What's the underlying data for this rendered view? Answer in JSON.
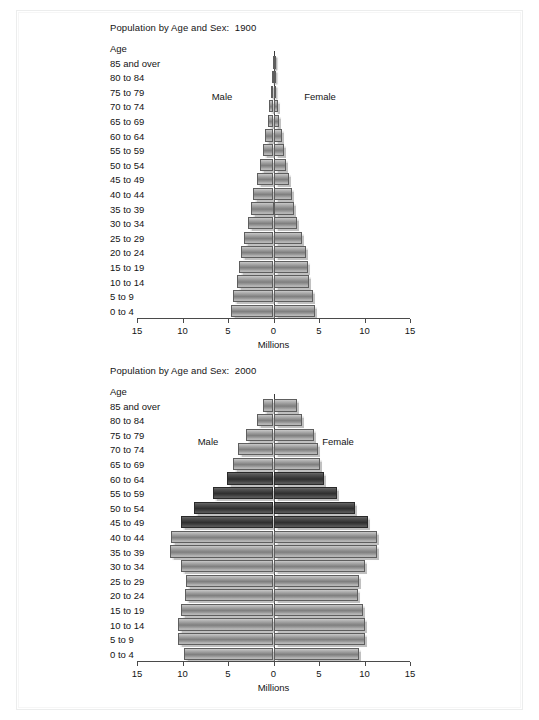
{
  "figure": {
    "background": "#ffffff",
    "frame_color": "#ececec"
  },
  "charts": [
    {
      "id": "chart-1900",
      "title": "Population by Age and Sex:  1900",
      "age_header": "Age",
      "xlabel": "Millions",
      "male_label": "Male",
      "female_label": "Female"
    },
    {
      "id": "chart-2000",
      "title": "Population by Age and Sex:  2000",
      "age_header": "Age",
      "xlabel": "Millions",
      "male_label": "Male",
      "female_label": "Female",
      "legend_label": "Baby boom"
    }
  ],
  "chart_data": [
    {
      "type": "bar",
      "subtype": "population-pyramid",
      "title": "Population by Age and Sex:  1900",
      "xlabel": "Millions",
      "ylabel": "Age",
      "xlim": [
        -15,
        15
      ],
      "xticks": [
        -15,
        -10,
        -5,
        0,
        5,
        10,
        15
      ],
      "xticklabels": [
        "15",
        "10",
        "5",
        "0",
        "5",
        "10",
        "15"
      ],
      "grid": false,
      "legend": null,
      "categories": [
        "0 to 4",
        "5 to 9",
        "10 to 14",
        "15 to 19",
        "20 to 24",
        "25 to 29",
        "30 to 34",
        "35 to 39",
        "40 to 44",
        "45 to 49",
        "50 to 54",
        "55 to 59",
        "60 to 64",
        "65 to 69",
        "70 to 74",
        "75 to 79",
        "80 to 84",
        "85 and over"
      ],
      "series": [
        {
          "name": "Male",
          "side": "left",
          "values": [
            4.7,
            4.4,
            4.0,
            3.8,
            3.6,
            3.2,
            2.8,
            2.5,
            2.2,
            1.8,
            1.5,
            1.1,
            0.9,
            0.6,
            0.45,
            0.28,
            0.15,
            0.08
          ]
        },
        {
          "name": "Female",
          "side": "right",
          "values": [
            4.6,
            4.3,
            3.9,
            3.8,
            3.6,
            3.1,
            2.6,
            2.3,
            2.0,
            1.7,
            1.4,
            1.1,
            0.9,
            0.6,
            0.45,
            0.28,
            0.16,
            0.1
          ]
        }
      ],
      "colors": {
        "bar": "#8f8f8f",
        "edge": "#5e5e5e"
      }
    },
    {
      "type": "bar",
      "subtype": "population-pyramid",
      "title": "Population by Age and Sex:  2000",
      "xlabel": "Millions",
      "ylabel": "Age",
      "xlim": [
        -15,
        15
      ],
      "xticks": [
        -15,
        -10,
        -5,
        0,
        5,
        10,
        15
      ],
      "xticklabels": [
        "15",
        "10",
        "5",
        "0",
        "5",
        "10",
        "15"
      ],
      "grid": false,
      "legend": {
        "position": "top-right",
        "entries": [
          "Baby boom"
        ]
      },
      "highlight_categories": [
        "45 to 49",
        "50 to 54",
        "55 to 59",
        "60 to 64"
      ],
      "categories": [
        "0 to 4",
        "5 to 9",
        "10 to 14",
        "15 to 19",
        "20 to 24",
        "25 to 29",
        "30 to 34",
        "35 to 39",
        "40 to 44",
        "45 to 49",
        "50 to 54",
        "55 to 59",
        "60 to 64",
        "65 to 69",
        "70 to 74",
        "75 to 79",
        "80 to 84",
        "85 and over"
      ],
      "series": [
        {
          "name": "Male",
          "side": "left",
          "values": [
            9.8,
            10.5,
            10.5,
            10.2,
            9.7,
            9.6,
            10.2,
            11.4,
            11.3,
            10.2,
            8.7,
            6.6,
            5.1,
            4.4,
            3.9,
            3.0,
            1.8,
            1.2
          ]
        },
        {
          "name": "Female",
          "side": "right",
          "values": [
            9.4,
            10.0,
            10.0,
            9.8,
            9.3,
            9.4,
            10.1,
            11.4,
            11.4,
            10.4,
            9.0,
            7.0,
            5.6,
            5.1,
            4.9,
            4.4,
            3.1,
            2.6
          ]
        }
      ],
      "colors": {
        "bar": "#8f8f8f",
        "bar_highlight": "#3a3a3a",
        "edge": "#5e5e5e"
      }
    }
  ]
}
